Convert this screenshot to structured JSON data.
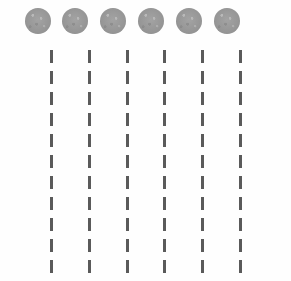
{
  "figure": {
    "type": "abstract-pattern-figure",
    "width": 291,
    "height": 281,
    "background_color": "#fefefe"
  },
  "markers": {
    "count": 6,
    "color": "#9c9c9c",
    "diameter": 26,
    "top": 8,
    "centers_x": [
      38,
      75,
      113,
      151,
      189,
      227
    ],
    "items": [
      {
        "label": "marker-1",
        "cx": 38,
        "cy": 21
      },
      {
        "label": "marker-2",
        "cx": 75,
        "cy": 21
      },
      {
        "label": "marker-3",
        "cx": 113,
        "cy": 21
      },
      {
        "label": "marker-4",
        "cx": 151,
        "cy": 21
      },
      {
        "label": "marker-5",
        "cx": 189,
        "cy": 21
      },
      {
        "label": "marker-6",
        "cx": 227,
        "cy": 21
      }
    ]
  },
  "dashed_lines": {
    "count": 6,
    "color": "#5a5a5a",
    "stroke_width": 3,
    "dash_length": 13,
    "dash_gap": 8,
    "dash_period": 21,
    "start_y": 50,
    "end_y": 281,
    "columns_x": [
      50,
      88,
      126,
      163,
      201,
      239
    ],
    "items": [
      {
        "label": "dash-column-1",
        "x": 50
      },
      {
        "label": "dash-column-2",
        "x": 88
      },
      {
        "label": "dash-column-3",
        "x": 126
      },
      {
        "label": "dash-column-4",
        "x": 163
      },
      {
        "label": "dash-column-5",
        "x": 201
      },
      {
        "label": "dash-column-6",
        "x": 239
      }
    ]
  }
}
